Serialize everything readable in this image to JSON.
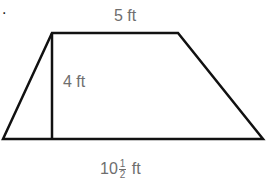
{
  "problem": {
    "marker_char": "7",
    "marker_period": "."
  },
  "figure": {
    "shape": "trapezoid",
    "vertices": {
      "bottom_left": [
        3,
        139
      ],
      "top_left": [
        52,
        33
      ],
      "top_right": [
        178,
        33
      ],
      "bottom_right": [
        263,
        139
      ]
    },
    "height_line": {
      "x": 52,
      "y1": 33,
      "y2": 139
    },
    "stroke_color": "#111111",
    "label_color": "#6e6e6e"
  },
  "labels": {
    "top_base": "5 ft",
    "height": "4 ft",
    "bottom_base_whole": "10",
    "bottom_base_num": "1",
    "bottom_base_den": "2",
    "bottom_base_unit": "ft"
  }
}
